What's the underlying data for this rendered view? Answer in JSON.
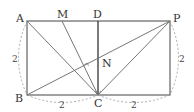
{
  "diagram": {
    "points": {
      "A": {
        "label": "A",
        "x": 27,
        "y": 21
      },
      "M": {
        "label": "M",
        "x": 62,
        "y": 21
      },
      "D": {
        "label": "D",
        "x": 98,
        "y": 21
      },
      "P": {
        "label": "P",
        "x": 170,
        "y": 21
      },
      "B": {
        "label": "B",
        "x": 27,
        "y": 95
      },
      "C": {
        "label": "C",
        "x": 98,
        "y": 95
      },
      "N": {
        "label": "N",
        "x": 98,
        "y": 58
      }
    },
    "lengths": {
      "left": "2",
      "right": "2",
      "bottom_left": "2",
      "bottom_right": "2"
    },
    "colors": {
      "line": "#444444",
      "dashed": "#888888"
    }
  }
}
